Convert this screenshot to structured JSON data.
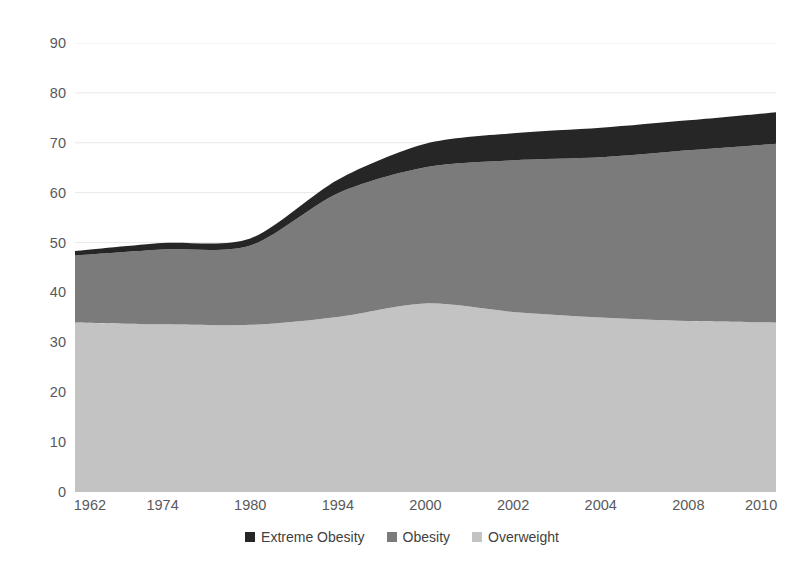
{
  "chart": {
    "title": "",
    "background": "#ffffff"
  },
  "chart_data": {
    "type": "area",
    "stacked": true,
    "title": "",
    "subtitle": "",
    "xlabel": "",
    "ylabel": "",
    "ylim": [
      0,
      90
    ],
    "ytick_step": 10,
    "grid": true,
    "grid_axis": "y",
    "legend_position": "bottom",
    "categories": [
      "1962",
      "1974",
      "1980",
      "1994",
      "2000",
      "2002",
      "2004",
      "2008",
      "2010"
    ],
    "yticks": [
      "0",
      "10",
      "20",
      "30",
      "40",
      "50",
      "60",
      "70",
      "80",
      "90"
    ],
    "series": [
      {
        "name": "Overweight",
        "color": "#c3c3c3",
        "stack_order": 1,
        "values": [
          34.0,
          33.6,
          33.5,
          35.1,
          37.8,
          36.1,
          35.0,
          34.3,
          34.0
        ]
      },
      {
        "name": "Obesity",
        "color": "#7b7b7b",
        "stack_order": 2,
        "values": [
          13.4,
          15.0,
          15.9,
          24.8,
          27.3,
          30.4,
          32.1,
          34.2,
          35.8
        ]
      },
      {
        "name": "Extreme Obesity",
        "color": "#262626",
        "stack_order": 3,
        "values": [
          0.9,
          1.3,
          1.4,
          2.7,
          4.7,
          5.4,
          5.9,
          6.0,
          6.3
        ]
      }
    ],
    "cumulative_totals": [
      48.3,
      49.9,
      50.8,
      62.6,
      69.8,
      71.9,
      73.0,
      74.5,
      76.1
    ],
    "top_boundary": [
      48.3,
      49.9,
      50.8,
      62.6,
      69.8,
      71.9,
      73.0,
      74.5,
      76.1
    ]
  },
  "axes": {
    "y_ticks": [
      {
        "label": "90",
        "value": 90
      },
      {
        "label": "80",
        "value": 80
      },
      {
        "label": "70",
        "value": 70
      },
      {
        "label": "60",
        "value": 60
      },
      {
        "label": "50",
        "value": 50
      },
      {
        "label": "40",
        "value": 40
      },
      {
        "label": "30",
        "value": 30
      },
      {
        "label": "20",
        "value": 20
      },
      {
        "label": "10",
        "value": 10
      },
      {
        "label": "0",
        "value": 0
      }
    ],
    "x_ticks": [
      {
        "label": "1962"
      },
      {
        "label": "1974"
      },
      {
        "label": "1980"
      },
      {
        "label": "1994"
      },
      {
        "label": "2000"
      },
      {
        "label": "2002"
      },
      {
        "label": "2004"
      },
      {
        "label": "2008"
      },
      {
        "label": "2010"
      }
    ]
  },
  "legend": {
    "items": [
      {
        "label": "Extreme Obesity",
        "color": "#262626"
      },
      {
        "label": "Obesity",
        "color": "#7b7b7b"
      },
      {
        "label": "Overweight",
        "color": "#c3c3c3"
      }
    ]
  },
  "style": {
    "gridline_color": "#e8e8e8",
    "axis_text_color": "#59595b",
    "legend_text_color": "#3f3f41"
  }
}
